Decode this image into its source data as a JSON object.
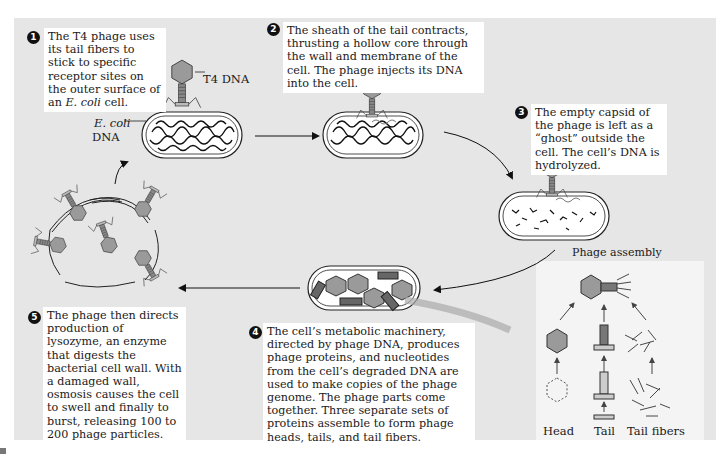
{
  "figure": {
    "steps": [
      {
        "number": "1",
        "text_parts": [
          "The T4 phage uses its tail fibers to stick to specific receptor sites on the outer surface of an ",
          "E. coli",
          " cell."
        ]
      },
      {
        "number": "2",
        "text": "The sheath of the tail contracts, thrusting a hollow core through the wall and membrane of the cell. The phage injects its DNA into the cell."
      },
      {
        "number": "3",
        "text": "The empty capsid of the phage is left as a “ghost” outside the cell. The cell’s DNA is hydrolyzed."
      },
      {
        "number": "4",
        "text": "The cell’s metabolic machinery, directed by phage DNA, produces phage proteins, and nucleotides from the cell’s degraded DNA are used to make copies of the phage genome. The phage parts come together. Three separate sets of proteins assemble to form phage heads, tails, and tail fibers."
      },
      {
        "number": "5",
        "text": "The phage then directs production of lysozyme, an enzyme that digests the bacterial cell wall. With a damaged wall, osmosis causes the cell to swell and finally to burst, releasing 100 to 200 phage particles."
      }
    ],
    "labels": {
      "t4_dna": "T4 DNA",
      "ecoli_italic": "E. coli",
      "ecoli_dna": "DNA",
      "phage_assembly": "Phage assembly",
      "head": "Head",
      "tail": "Tail",
      "tail_fibers": "Tail fibers"
    },
    "colors": {
      "panel_background": "#e6e6e6",
      "caption_background": "#ffffff",
      "phage_head": "#9a9a9a",
      "outline": "#222222"
    }
  }
}
